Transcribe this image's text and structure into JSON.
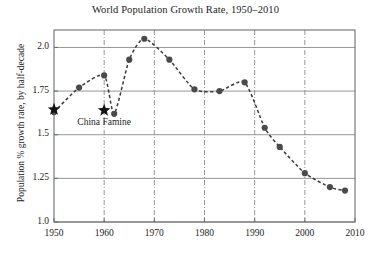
{
  "chart_data": {
    "type": "line",
    "title": "World Population Growth Rate, 1950–2010",
    "xlabel": "",
    "ylabel": "Population % growth rate, by half-decade",
    "xlim": [
      1950,
      2010
    ],
    "ylim": [
      1.0,
      2.1
    ],
    "grid": true,
    "legend": null,
    "x_ticks": [
      1950,
      1960,
      1970,
      1980,
      1990,
      2000,
      2010
    ],
    "x_tick_labels": [
      "1950",
      "1960",
      "1970",
      "1980",
      "1990",
      "2000",
      "2010"
    ],
    "y_ticks": [
      1.0,
      1.25,
      1.5,
      1.75,
      2.0
    ],
    "y_tick_labels": [
      "1.0",
      "1.25",
      "1.5",
      "1.75",
      "2.0"
    ],
    "line_style": "dashed",
    "marker": "circle",
    "marker_color": "#4a4a4a",
    "line_color": "#3a3a3a",
    "x": [
      1950,
      1955,
      1960,
      1962,
      1965,
      1968,
      1973,
      1978,
      1983,
      1988,
      1992,
      1995,
      2000,
      2005,
      2008
    ],
    "values": [
      1.63,
      1.77,
      1.84,
      1.62,
      1.93,
      2.05,
      1.93,
      1.76,
      1.75,
      1.8,
      1.54,
      1.43,
      1.28,
      1.2,
      1.18
    ],
    "series": [
      {
        "name": "World population growth rate",
        "points": [
          {
            "x": 1950,
            "y": 1.63
          },
          {
            "x": 1955,
            "y": 1.77
          },
          {
            "x": 1960,
            "y": 1.84
          },
          {
            "x": 1962,
            "y": 1.62
          },
          {
            "x": 1965,
            "y": 1.93
          },
          {
            "x": 1968,
            "y": 2.05
          },
          {
            "x": 1973,
            "y": 1.93
          },
          {
            "x": 1978,
            "y": 1.76
          },
          {
            "x": 1983,
            "y": 1.75
          },
          {
            "x": 1988,
            "y": 1.8
          },
          {
            "x": 1992,
            "y": 1.54
          },
          {
            "x": 1995,
            "y": 1.43
          },
          {
            "x": 2000,
            "y": 1.28
          },
          {
            "x": 2005,
            "y": 1.2
          },
          {
            "x": 2008,
            "y": 1.18
          }
        ]
      }
    ],
    "annotations": [
      {
        "name": "china-famine",
        "label": "China Famine",
        "marker": "star",
        "marker_x": 1960,
        "marker_y": 1.64,
        "label_x": 1960,
        "label_y": 1.57
      },
      {
        "name": "start-marker",
        "label": "",
        "marker": "star",
        "marker_x": 1950,
        "marker_y": 1.645
      }
    ],
    "vertical_reference_lines": [
      1960,
      1970,
      1980,
      1990,
      2000
    ]
  },
  "colors": {
    "background": "#ffffff",
    "axis": "#6e6e6e",
    "grid": "#8a8a8a",
    "text": "#1c1c1c",
    "marker": "#4a4a4a",
    "line": "#3a3a3a",
    "star": "#141414"
  }
}
